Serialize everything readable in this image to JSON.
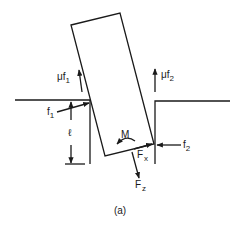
{
  "figure": {
    "caption": "(a)",
    "stroke_color": "#1a1a1a",
    "background": "#ffffff"
  },
  "labels": {
    "mu_f1": {
      "prefix": "μf",
      "sub": "1"
    },
    "mu_f2": {
      "prefix": "μf",
      "sub": "2"
    },
    "f1": {
      "prefix": "f",
      "sub": "1"
    },
    "f2": {
      "prefix": "f",
      "sub": "2"
    },
    "ell": "ℓ",
    "M": "M",
    "Fx": {
      "prefix": "F",
      "sub": "x"
    },
    "Fz": {
      "prefix": "F",
      "sub": "z"
    }
  }
}
